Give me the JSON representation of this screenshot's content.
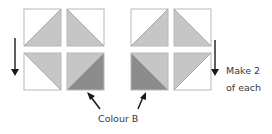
{
  "diagram": {
    "colors": {
      "background": "#ffffff",
      "white_fill": "#ffffff",
      "light_fill": "#c6c6c6",
      "dark_fill": "#8c8c8c",
      "border": "#b8b8b8",
      "arrow": "#1a1a1a",
      "text": "#3a3a3a"
    },
    "groups": [
      {
        "name": "left-group",
        "squares": [
          {
            "position": "top-left",
            "diagonal": "bottom-left-to-top-right",
            "upper": "white",
            "lower": "light"
          },
          {
            "position": "top-right",
            "diagonal": "top-left-to-bottom-right",
            "upper": "white",
            "lower": "light"
          },
          {
            "position": "bottom-left",
            "diagonal": "top-left-to-bottom-right",
            "upper": "light",
            "lower": "white"
          },
          {
            "position": "bottom-right",
            "diagonal": "bottom-left-to-top-right",
            "upper": "light",
            "lower": "dark"
          }
        ]
      },
      {
        "name": "right-group",
        "squares": [
          {
            "position": "top-left",
            "diagonal": "bottom-left-to-top-right",
            "upper": "white",
            "lower": "light"
          },
          {
            "position": "top-right",
            "diagonal": "top-left-to-bottom-right",
            "upper": "white",
            "lower": "light"
          },
          {
            "position": "bottom-left",
            "diagonal": "top-left-to-bottom-right",
            "upper": "light",
            "lower": "dark"
          },
          {
            "position": "bottom-right",
            "diagonal": "bottom-left-to-top-right",
            "upper": "light",
            "lower": "white"
          }
        ]
      }
    ],
    "labels": {
      "make_line1": "Make 2",
      "make_line2": "of each",
      "colour": "Colour B"
    },
    "arrows": [
      {
        "name": "left-down-arrow",
        "direction": "down"
      },
      {
        "name": "right-down-arrow",
        "direction": "down"
      },
      {
        "name": "colour-b-pointer-left",
        "direction": "up-left"
      },
      {
        "name": "colour-b-pointer-right",
        "direction": "up-right"
      }
    ]
  }
}
